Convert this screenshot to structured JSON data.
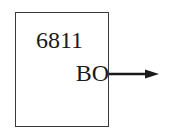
{
  "diagram": {
    "block": {
      "chip_label": "6811",
      "pin_label": "BO"
    },
    "output_arrow": {
      "direction": "right",
      "color": "#1a1a1a"
    }
  }
}
